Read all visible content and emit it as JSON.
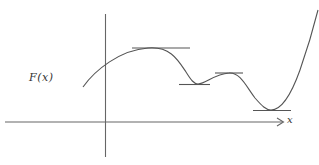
{
  "diagram": {
    "function_label": "F(x)",
    "x_axis_label": "x",
    "line_color": "#555555",
    "axes": {
      "y_axis": {
        "x": 105.5,
        "y_top": 14,
        "y_bottom": 157
      },
      "x_axis": {
        "y": 122,
        "x_left": 5,
        "x_right": 284
      }
    },
    "stationary_points": [
      {
        "type": "local-maximum",
        "x": 160,
        "y": 48,
        "tangent": [
          132,
          190
        ]
      },
      {
        "type": "local-minimum",
        "x": 196,
        "y": 84,
        "tangent": [
          180,
          210
        ]
      },
      {
        "type": "local-maximum",
        "x": 229,
        "y": 73,
        "tangent": [
          215,
          243
        ]
      },
      {
        "type": "global-minimum",
        "x": 272,
        "y": 110,
        "tangent": [
          253,
          291
        ]
      }
    ]
  }
}
